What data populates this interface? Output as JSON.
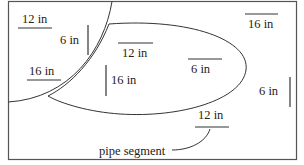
{
  "diagram": {
    "colors": {
      "stroke": "#333333",
      "text": "#222222",
      "background": "#ffffff"
    },
    "segments": [
      {
        "id": "seg1",
        "label": "12 in",
        "orientation": "horizontal"
      },
      {
        "id": "seg2",
        "label": "6 in",
        "orientation": "vertical"
      },
      {
        "id": "seg3",
        "label": "12 in",
        "orientation": "horizontal"
      },
      {
        "id": "seg4",
        "label": "16 in",
        "orientation": "horizontal"
      },
      {
        "id": "seg5",
        "label": "16 in",
        "orientation": "vertical"
      },
      {
        "id": "seg6",
        "label": "6 in",
        "orientation": "horizontal"
      },
      {
        "id": "seg7",
        "label": "16 in",
        "orientation": "horizontal"
      },
      {
        "id": "seg8",
        "label": "6 in",
        "orientation": "vertical"
      },
      {
        "id": "seg9",
        "label": "12 in",
        "orientation": "horizontal"
      }
    ],
    "callout": {
      "label": "pipe segment"
    }
  }
}
